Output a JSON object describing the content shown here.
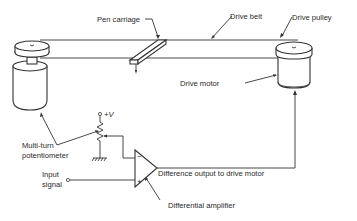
{
  "diagram": {
    "labels": {
      "pen_carriage": "Pen carriage",
      "drive_belt": "Drive belt",
      "drive_pulley": "Drive pulley",
      "drive_motor": "Drive motor",
      "potentiometer_line1": "Multi-turn",
      "potentiometer_line2": "potentiometer",
      "supply": "+V",
      "input_line1": "Input",
      "input_line2": "signal",
      "difference_output": "Difference output to drive motor",
      "diff_amp": "Differential amplifier",
      "minus": "−",
      "plus": "+"
    }
  }
}
